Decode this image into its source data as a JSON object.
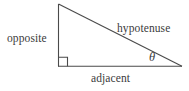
{
  "figure": {
    "type": "right-triangle-trigonometry-diagram",
    "canvas": {
      "width": 189,
      "height": 91,
      "background": "#ffffff"
    },
    "stroke_color": "#4a4a4a",
    "text_color": "#3b3b3b",
    "triangle": {
      "apex": {
        "x": 58,
        "y": 4
      },
      "right_angle_vertex": {
        "x": 58,
        "y": 66
      },
      "theta_vertex": {
        "x": 182,
        "y": 66
      },
      "right_angle_marker_size": 9
    },
    "labels": {
      "opposite": "opposite",
      "hypotenuse": "hypotenuse",
      "adjacent": "adjacent",
      "theta": "θ"
    }
  }
}
